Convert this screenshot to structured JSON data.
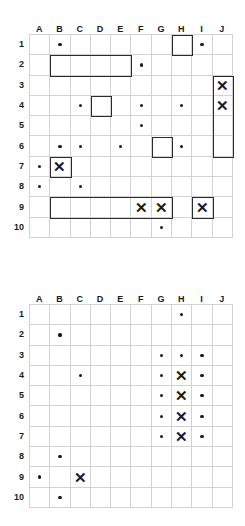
{
  "page": {
    "background_color": "#ffffff",
    "mark_color": "#1b1b1b",
    "gridline_color": "#d2d2d2",
    "box_color": "#2b2b2b"
  },
  "grids": [
    {
      "id": "grid-1",
      "columns": [
        "A",
        "B",
        "C",
        "D",
        "E",
        "F",
        "G",
        "H",
        "I",
        "J"
      ],
      "rows": [
        "1",
        "2",
        "3",
        "4",
        "5",
        "6",
        "7",
        "8",
        "9",
        "10"
      ],
      "cells": [
        [
          null,
          "dot",
          null,
          null,
          null,
          null,
          null,
          null,
          "dot",
          null
        ],
        [
          null,
          null,
          null,
          null,
          null,
          "dot",
          null,
          null,
          null,
          null
        ],
        [
          null,
          null,
          null,
          null,
          null,
          null,
          null,
          null,
          null,
          "x"
        ],
        [
          null,
          null,
          "dot",
          null,
          null,
          "dot",
          null,
          "dot",
          null,
          "x"
        ],
        [
          null,
          null,
          null,
          null,
          null,
          "dot",
          null,
          null,
          null,
          null
        ],
        [
          null,
          "dot",
          "dot",
          null,
          "dot",
          null,
          null,
          "dot",
          null,
          null
        ],
        [
          "dot",
          "x",
          null,
          null,
          null,
          null,
          null,
          null,
          null,
          null
        ],
        [
          "dot",
          null,
          "dot",
          null,
          null,
          null,
          null,
          null,
          null,
          null
        ],
        [
          null,
          null,
          null,
          null,
          null,
          "x",
          "x",
          null,
          "x",
          null
        ],
        [
          null,
          null,
          null,
          null,
          null,
          null,
          "dot",
          null,
          null,
          null
        ]
      ],
      "boxes": [
        {
          "label": "box-h1",
          "col_start": 8,
          "col_end": 8,
          "row_start": 1,
          "row_end": 1
        },
        {
          "label": "box-b2-e2",
          "col_start": 2,
          "col_end": 5,
          "row_start": 2,
          "row_end": 2
        },
        {
          "label": "box-j3-j6",
          "col_start": 10,
          "col_end": 10,
          "row_start": 3,
          "row_end": 6
        },
        {
          "label": "box-d4",
          "col_start": 4,
          "col_end": 4,
          "row_start": 4,
          "row_end": 4
        },
        {
          "label": "box-g6",
          "col_start": 7,
          "col_end": 7,
          "row_start": 6,
          "row_end": 6
        },
        {
          "label": "box-b7",
          "col_start": 2,
          "col_end": 2,
          "row_start": 7,
          "row_end": 7
        },
        {
          "label": "box-b9-g9",
          "col_start": 2,
          "col_end": 7,
          "row_start": 9,
          "row_end": 9
        },
        {
          "label": "box-i9",
          "col_start": 9,
          "col_end": 9,
          "row_start": 9,
          "row_end": 9
        }
      ]
    },
    {
      "id": "grid-2",
      "columns": [
        "A",
        "B",
        "C",
        "D",
        "E",
        "F",
        "G",
        "H",
        "I",
        "J"
      ],
      "rows": [
        "1",
        "2",
        "3",
        "4",
        "5",
        "6",
        "7",
        "8",
        "9",
        "10"
      ],
      "cells": [
        [
          null,
          null,
          null,
          null,
          null,
          null,
          null,
          "dot",
          null,
          null
        ],
        [
          null,
          "dot",
          null,
          null,
          null,
          null,
          null,
          null,
          null,
          null
        ],
        [
          null,
          null,
          null,
          null,
          null,
          null,
          "dot",
          "dot",
          "dot",
          null
        ],
        [
          null,
          null,
          "dot",
          null,
          null,
          null,
          "dot",
          "x",
          "dot",
          null
        ],
        [
          null,
          null,
          null,
          null,
          null,
          null,
          "dot",
          "x",
          "dot",
          null
        ],
        [
          null,
          null,
          null,
          null,
          null,
          null,
          "dot",
          "x",
          "dot",
          null
        ],
        [
          null,
          null,
          null,
          null,
          null,
          null,
          "dot",
          "x",
          "dot",
          null
        ],
        [
          null,
          "dot",
          null,
          null,
          null,
          null,
          null,
          null,
          null,
          null
        ],
        [
          "dot",
          null,
          "x",
          null,
          null,
          null,
          null,
          null,
          null,
          null
        ],
        [
          null,
          "dot",
          null,
          null,
          null,
          null,
          null,
          null,
          null,
          null
        ]
      ],
      "boxes": []
    }
  ]
}
